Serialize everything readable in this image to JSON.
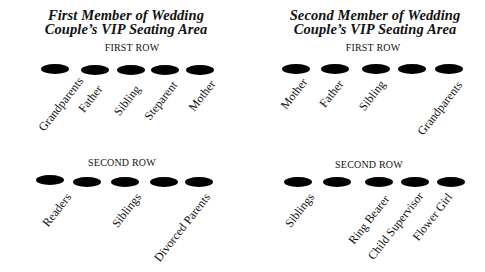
{
  "panels": [
    {
      "title_line1": "First Member of Wedding",
      "title_line2": "Couple’s VIP Seating Area",
      "rows": [
        {
          "label": "FIRST ROW",
          "seats": [
            "Grandparents",
            "Father",
            "Sibling",
            "Steparent",
            "Mother"
          ]
        },
        {
          "label": "SECOND ROW",
          "seats": [
            "Readers",
            "",
            "Siblings",
            "",
            "Divorced Parents"
          ]
        }
      ]
    },
    {
      "title_line1": "Second Member of Wedding",
      "title_line2": "Couple’s VIP Seating Area",
      "rows": [
        {
          "label": "FIRST ROW",
          "seats": [
            "Mother",
            "Father",
            "Sibling",
            "",
            "Grandparents"
          ]
        },
        {
          "label": "SECOND ROW",
          "seats": [
            "Siblings",
            "",
            "Ring Bearer",
            "Child Supervisor",
            "Flower Girl"
          ]
        }
      ]
    }
  ],
  "colors": {
    "seat": "#000000",
    "text": "#111111",
    "background": "#ffffff"
  }
}
